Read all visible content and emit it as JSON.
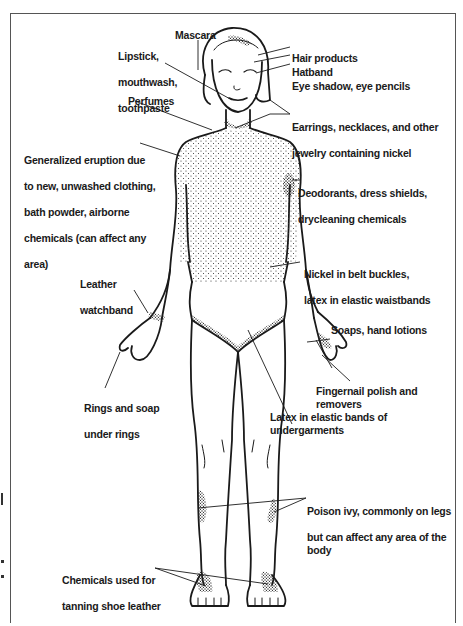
{
  "diagram": {
    "labels": [
      {
        "id": "mascara",
        "lines": [
          "Mascara"
        ]
      },
      {
        "id": "lipstick",
        "lines": [
          "Lipstick,",
          "mouthwash,",
          "toothpaste"
        ]
      },
      {
        "id": "hair-products",
        "lines": [
          "Hair products"
        ]
      },
      {
        "id": "hatband",
        "lines": [
          "Hatband"
        ]
      },
      {
        "id": "eye-shadow",
        "lines": [
          "Eye shadow, eye pencils"
        ]
      },
      {
        "id": "perfumes",
        "lines": [
          "Perfumes"
        ]
      },
      {
        "id": "earrings",
        "lines": [
          "Earrings, necklaces, and other",
          "jewelry containing nickel"
        ]
      },
      {
        "id": "generalized",
        "lines": [
          "Generalized eruption due",
          "to new, unwashed clothing,",
          "bath powder, airborne",
          "chemicals (can affect any",
          "area)"
        ]
      },
      {
        "id": "deodorants",
        "lines": [
          "Deodorants, dress shields,",
          "drycleaning chemicals"
        ]
      },
      {
        "id": "nickel-belt",
        "lines": [
          "Nickel in belt buckles,",
          "latex in elastic waistbands"
        ]
      },
      {
        "id": "leather-watchband",
        "lines": [
          "Leather",
          "watchband"
        ]
      },
      {
        "id": "soaps",
        "lines": [
          "Soaps, hand lotions"
        ]
      },
      {
        "id": "rings",
        "lines": [
          "Rings and soap",
          "under rings"
        ]
      },
      {
        "id": "fingernail",
        "lines": [
          "Fingernail polish and removers"
        ]
      },
      {
        "id": "latex-undergarments",
        "lines": [
          "Latex in elastic bands of undergarments"
        ]
      },
      {
        "id": "poison-ivy",
        "lines": [
          "Poison ivy, commonly on legs",
          "but can affect any area of the body"
        ]
      },
      {
        "id": "shoe-leather",
        "lines": [
          "Chemicals used for",
          "tanning shoe leather"
        ]
      }
    ],
    "colors": {
      "line": "#1a1a1a",
      "text": "#1a1a1a",
      "frame": "#555555",
      "background": "#ffffff"
    }
  }
}
